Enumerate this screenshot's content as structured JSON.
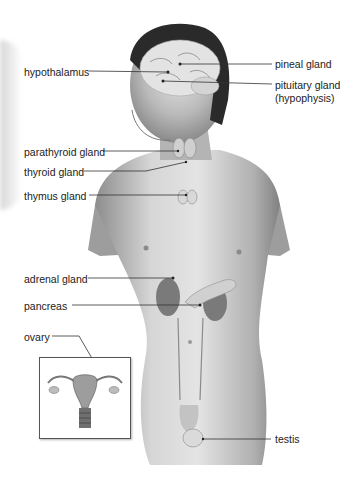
{
  "diagram": {
    "labels": {
      "left": [
        {
          "id": "hypothalamus",
          "text": "hypothalamus"
        },
        {
          "id": "parathyroid",
          "text": "parathyroid gland"
        },
        {
          "id": "thyroid",
          "text": "thyroid gland"
        },
        {
          "id": "thymus",
          "text": "thymus gland"
        },
        {
          "id": "adrenal",
          "text": "adrenal gland"
        },
        {
          "id": "pancreas",
          "text": "pancreas"
        },
        {
          "id": "ovary",
          "text": "ovary"
        }
      ],
      "right": [
        {
          "id": "pineal",
          "text": "pineal gland"
        },
        {
          "id": "pituitary",
          "text": "pituitary gland"
        },
        {
          "id": "pituitary_alt",
          "text": "(hypophysis)"
        },
        {
          "id": "testis",
          "text": "testis"
        }
      ]
    },
    "inset": {
      "subject": "female reproductive organs (uterus and ovaries)"
    },
    "colors": {
      "leader_line": "#333333",
      "skin_mid": "#a8a8a8",
      "hair": "#2a2a2a",
      "background": "#ffffff"
    }
  }
}
